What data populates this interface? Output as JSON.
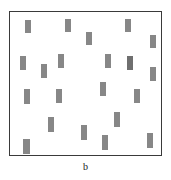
{
  "figure": {
    "caption": "b",
    "panel_label": "b",
    "background_color": "#ffffff",
    "border_color": "#3a3a3a"
  },
  "chart_data": {
    "type": "scatter",
    "title": "",
    "subtitle": "",
    "xlabel": "",
    "ylabel": "",
    "caption": "b",
    "grid": false,
    "legend": null,
    "axis_ticks": false,
    "xlim": [
      0,
      153
    ],
    "ylim": [
      0,
      145
    ],
    "marker": {
      "shape": "rectangle",
      "orientation": "vertical",
      "width": 6,
      "height": 14,
      "fill": "#878787",
      "fill_dark": "#6f6f6f"
    },
    "count": 20,
    "points": [
      {
        "id": 1,
        "x": 15,
        "y": 8,
        "w": 6,
        "h": 13,
        "color": "#878787"
      },
      {
        "id": 2,
        "x": 55,
        "y": 7,
        "w": 6,
        "h": 13,
        "color": "#878787"
      },
      {
        "id": 3,
        "x": 115,
        "y": 7,
        "w": 6,
        "h": 13,
        "color": "#878787"
      },
      {
        "id": 4,
        "x": 76,
        "y": 20,
        "w": 6,
        "h": 13,
        "color": "#878787"
      },
      {
        "id": 5,
        "x": 140,
        "y": 23,
        "w": 6,
        "h": 13,
        "color": "#878787"
      },
      {
        "id": 6,
        "x": 10,
        "y": 44,
        "w": 6,
        "h": 14,
        "color": "#878787"
      },
      {
        "id": 7,
        "x": 48,
        "y": 42,
        "w": 6,
        "h": 14,
        "color": "#878787"
      },
      {
        "id": 8,
        "x": 95,
        "y": 42,
        "w": 6,
        "h": 14,
        "color": "#878787"
      },
      {
        "id": 9,
        "x": 117,
        "y": 44,
        "w": 6,
        "h": 14,
        "color": "#6f6f6f"
      },
      {
        "id": 10,
        "x": 31,
        "y": 52,
        "w": 6,
        "h": 14,
        "color": "#878787"
      },
      {
        "id": 11,
        "x": 140,
        "y": 55,
        "w": 6,
        "h": 14,
        "color": "#878787"
      },
      {
        "id": 12,
        "x": 90,
        "y": 70,
        "w": 6,
        "h": 14,
        "color": "#878787"
      },
      {
        "id": 13,
        "x": 14,
        "y": 77,
        "w": 6,
        "h": 15,
        "color": "#878787"
      },
      {
        "id": 14,
        "x": 46,
        "y": 77,
        "w": 6,
        "h": 14,
        "color": "#878787"
      },
      {
        "id": 15,
        "x": 124,
        "y": 77,
        "w": 6,
        "h": 14,
        "color": "#878787"
      },
      {
        "id": 16,
        "x": 38,
        "y": 105,
        "w": 6,
        "h": 15,
        "color": "#878787"
      },
      {
        "id": 17,
        "x": 104,
        "y": 100,
        "w": 6,
        "h": 15,
        "color": "#878787"
      },
      {
        "id": 18,
        "x": 71,
        "y": 113,
        "w": 6,
        "h": 15,
        "color": "#878787"
      },
      {
        "id": 19,
        "x": 92,
        "y": 123,
        "w": 6,
        "h": 15,
        "color": "#878787"
      },
      {
        "id": 20,
        "x": 13,
        "y": 127,
        "w": 7,
        "h": 15,
        "color": "#878787"
      },
      {
        "id": 21,
        "x": 137,
        "y": 121,
        "w": 6,
        "h": 15,
        "color": "#878787"
      }
    ]
  }
}
